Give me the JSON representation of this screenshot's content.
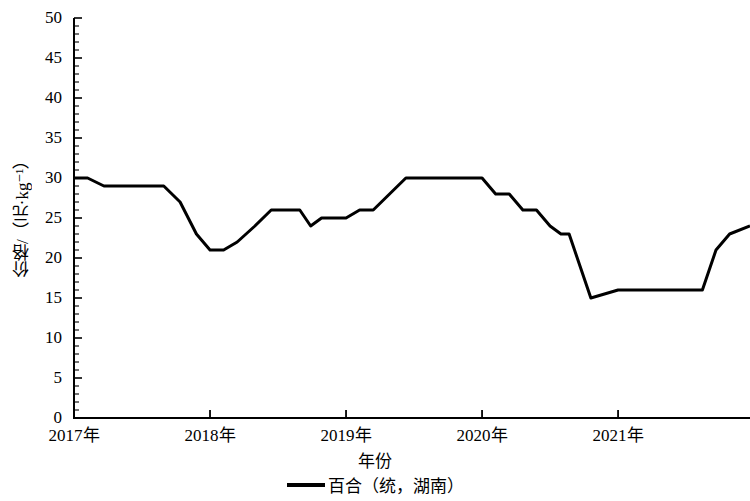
{
  "chart_data": {
    "type": "line",
    "title": "",
    "xlabel": "年份",
    "ylabel": "价格/（元·kg⁻¹）",
    "ylim": [
      0,
      50
    ],
    "ytick_labels": [
      "0",
      "5",
      "10",
      "15",
      "20",
      "25",
      "30",
      "35",
      "40",
      "45",
      "50"
    ],
    "ytick_values": [
      0,
      5,
      10,
      15,
      20,
      25,
      30,
      35,
      40,
      45,
      50
    ],
    "ytick_minor_step": 1,
    "xtick_labels": [
      "2017年",
      "2018年",
      "2019年",
      "2020年",
      "2021年"
    ],
    "xtick_values": [
      2017,
      2018,
      2019,
      2020,
      2021
    ],
    "xlim": [
      2017,
      2021.97
    ],
    "grid": false,
    "legend_position": "bottom-center",
    "line_color": "#000000",
    "line_width": 3,
    "series": [
      {
        "name": "百合（统，湖南）",
        "x": [
          2017.0,
          2017.1,
          2017.22,
          2017.38,
          2017.5,
          2017.66,
          2017.78,
          2017.9,
          2018.0,
          2018.1,
          2018.2,
          2018.33,
          2018.45,
          2018.56,
          2018.66,
          2018.74,
          2018.82,
          2018.9,
          2019.0,
          2019.1,
          2019.2,
          2019.32,
          2019.44,
          2019.56,
          2019.68,
          2019.8,
          2019.9,
          2020.0,
          2020.1,
          2020.2,
          2020.3,
          2020.4,
          2020.5,
          2020.58,
          2020.64,
          2020.72,
          2020.8,
          2021.0,
          2021.2,
          2021.45,
          2021.62,
          2021.72,
          2021.82,
          2021.97
        ],
        "values": [
          30,
          30,
          29,
          29,
          29,
          29,
          27,
          23,
          21,
          21,
          22,
          24,
          26,
          26,
          26,
          24,
          25,
          25,
          25,
          26,
          26,
          28,
          30,
          30,
          30,
          30,
          30,
          30,
          28,
          28,
          26,
          26,
          24,
          23,
          23,
          19,
          15,
          16,
          16,
          16,
          16,
          21,
          23,
          24
        ]
      }
    ],
    "legend_entries": [
      {
        "label": "百合（统，湖南）",
        "marker": "line",
        "color": "#000000"
      }
    ]
  }
}
